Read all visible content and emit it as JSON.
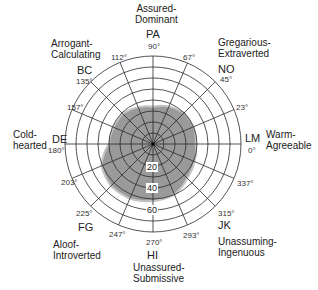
{
  "chart_data": {
    "type": "polar-area",
    "title": "",
    "center_px": [
      153,
      144
    ],
    "radial_ticks": [
      20,
      40,
      60
    ],
    "radial_max": 80,
    "ring_step": 10,
    "spoke_angles_deg": [
      0,
      23,
      45,
      67,
      90,
      112,
      135,
      157,
      180,
      203,
      225,
      247,
      270,
      293,
      315,
      337
    ],
    "octants": [
      {
        "code": "LM",
        "angle": 0,
        "label": "Warm-\nAgreeable"
      },
      {
        "code": "NO",
        "angle": 45,
        "label": "Gregarious-\nExtraverted"
      },
      {
        "code": "PA",
        "angle": 90,
        "label": "Assured-\nDominant"
      },
      {
        "code": "BC",
        "angle": 135,
        "label": "Arrogant-\nCalculating"
      },
      {
        "code": "DE",
        "angle": 180,
        "label": "Cold-\nhearted"
      },
      {
        "code": "FG",
        "angle": 225,
        "label": "Aloof-\nIntroverted"
      },
      {
        "code": "HI",
        "angle": 270,
        "label": "Unassured-\nSubmissive"
      },
      {
        "code": "JK",
        "angle": 315,
        "label": "Unassuming-\nIngenuous"
      }
    ],
    "profile": {
      "angles": [
        0,
        23,
        45,
        67,
        90,
        112,
        135,
        157,
        180,
        203,
        225,
        247,
        270,
        293,
        315,
        337
      ],
      "values": [
        38,
        39,
        39,
        36,
        33,
        35,
        38,
        38,
        39,
        50,
        53,
        53,
        51,
        49,
        43,
        40
      ],
      "fill": "#9a9a9a"
    }
  },
  "labels": {
    "pa_desc_1": "Assured-",
    "pa_desc_2": "Dominant",
    "pa_code": "PA",
    "pa_deg": "90°",
    "bc_desc_1": "Arrogant-",
    "bc_desc_2": "Calculating",
    "bc_code": "BC",
    "bc_deg": "135°",
    "no_desc_1": "Gregarious-",
    "no_desc_2": "Extraverted",
    "no_code": "NO",
    "no_deg": "45°",
    "de_desc_1": "Cold-",
    "de_desc_2": "hearted",
    "de_code": "DE",
    "de_deg": "180°",
    "lm_desc_1": "Warm-",
    "lm_desc_2": "Agreeable",
    "lm_code": "LM",
    "lm_deg": "0°",
    "fg_desc_1": "Aloof-",
    "fg_desc_2": "Introverted",
    "fg_code": "FG",
    "fg_deg": "225°",
    "hi_desc_1": "Unassured-",
    "hi_desc_2": "Submissive",
    "hi_code": "HI",
    "hi_deg": "270°",
    "jk_desc_1": "Unassuming-",
    "jk_desc_2": "Ingenuous",
    "jk_code": "JK",
    "jk_deg": "315°",
    "deg_112": "112°",
    "deg_67": "67°",
    "deg_157": "157°",
    "deg_23": "23°",
    "deg_203": "203°",
    "deg_337": "337°",
    "deg_247": "247°",
    "deg_293": "293°",
    "ring_20": "20",
    "ring_40": "40",
    "ring_60": "60"
  }
}
